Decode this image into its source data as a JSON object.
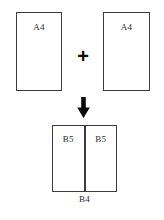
{
  "diagram": {
    "background_color": "#ffffff",
    "line_color": "#3c3c3c",
    "text_color": "#2b2b2b",
    "inputs": [
      {
        "label": "A4",
        "name": "a4-left"
      },
      {
        "label": "A4",
        "name": "a4-right"
      }
    ],
    "operator": {
      "symbol": "+",
      "name": "plus"
    },
    "flow": {
      "arrow": "down-arrow"
    },
    "output": {
      "caption": "B4",
      "halves": [
        {
          "label": "B5"
        },
        {
          "label": "B5"
        }
      ]
    }
  }
}
